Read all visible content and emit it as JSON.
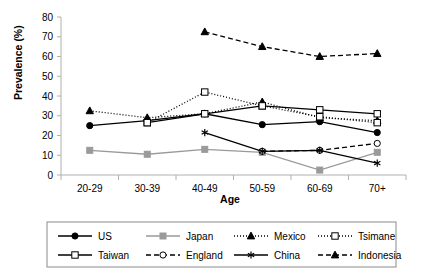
{
  "chart_data": {
    "type": "line",
    "title": "",
    "xlabel": "Age",
    "ylabel": "Prevalence (%)",
    "categories": [
      "20-29",
      "30-39",
      "40-49",
      "50-59",
      "60-69",
      "70+"
    ],
    "ylim": [
      0,
      80
    ],
    "yticks": [
      0,
      10,
      20,
      30,
      40,
      50,
      60,
      70,
      80
    ],
    "ytick_labels": [
      "0",
      "10",
      "20",
      "30",
      "40",
      "50",
      "60",
      "70",
      "80"
    ],
    "grid": false,
    "legend_position": "bottom",
    "series": [
      {
        "name": "US",
        "values": [
          25.0,
          27.5,
          31.0,
          25.5,
          27.0,
          21.5
        ],
        "color": "#000000",
        "line_style": "solid",
        "marker": "filled-circle"
      },
      {
        "name": "Japan",
        "values": [
          12.5,
          10.5,
          13.0,
          11.5,
          2.5,
          11.5
        ],
        "color": "#9a9a9a",
        "line_style": "solid",
        "marker": "filled-square"
      },
      {
        "name": "Mexico",
        "values": [
          32.5,
          29.0,
          31.0,
          37.0,
          29.0,
          27.5
        ],
        "color": "#000000",
        "line_style": "dotted",
        "marker": "filled-triangle"
      },
      {
        "name": "Tsimane",
        "values": [
          null,
          26.5,
          42.0,
          35.0,
          29.5,
          26.5
        ],
        "color": "#000000",
        "line_style": "dotted",
        "marker": "open-square"
      },
      {
        "name": "Taiwan",
        "values": [
          null,
          26.5,
          31.0,
          35.0,
          33.0,
          31.0
        ],
        "color": "#000000",
        "line_style": "solid",
        "marker": "open-square"
      },
      {
        "name": "England",
        "values": [
          null,
          null,
          null,
          12.0,
          12.5,
          16.0
        ],
        "color": "#000000",
        "line_style": "dashed",
        "marker": "open-circle"
      },
      {
        "name": "China",
        "values": [
          null,
          null,
          21.5,
          12.0,
          12.5,
          6.0
        ],
        "color": "#000000",
        "line_style": "solid",
        "marker": "asterisk"
      },
      {
        "name": "Indonesia",
        "values": [
          null,
          null,
          72.5,
          65.0,
          60.0,
          61.5
        ],
        "color": "#000000",
        "line_style": "dashed",
        "marker": "filled-triangle"
      }
    ]
  },
  "legend": {
    "rows": [
      [
        "US",
        "Japan",
        "Mexico",
        "Tsimane"
      ],
      [
        "Taiwan",
        "England",
        "China",
        "Indonesia"
      ]
    ]
  },
  "colors": {
    "axis": "#b0b0b0",
    "legend_border": "#8a8a8a",
    "gray_series": "#9a9a9a",
    "black_series": "#000000"
  }
}
